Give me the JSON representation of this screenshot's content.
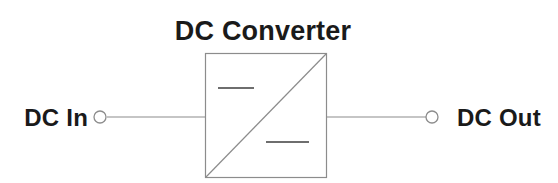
{
  "diagram": {
    "type": "block-diagram",
    "title": "DC Converter",
    "background_color": "#ffffff",
    "line_color": "#8c8c8c",
    "text_color": "#1a1a1a",
    "input": {
      "label": "DC In",
      "terminal": "open-circle"
    },
    "output": {
      "label": "DC Out",
      "terminal": "open-circle"
    },
    "block": {
      "name": "DC Converter",
      "symbol": "diagonal-with-dc-dashes",
      "input_side_marking": "dc-dash",
      "output_side_marking": "dc-dash"
    }
  }
}
